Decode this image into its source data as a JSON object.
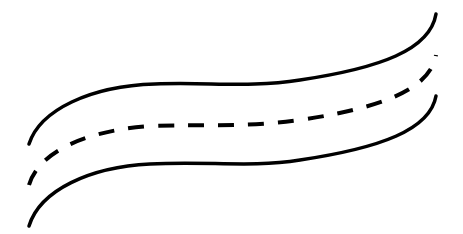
{
  "illustration": {
    "subject": "wavy road with dashed center line",
    "background_color": "#ffffff",
    "stroke_color": "#000000",
    "edge_lines": 2,
    "center_line_style": "dashed"
  }
}
